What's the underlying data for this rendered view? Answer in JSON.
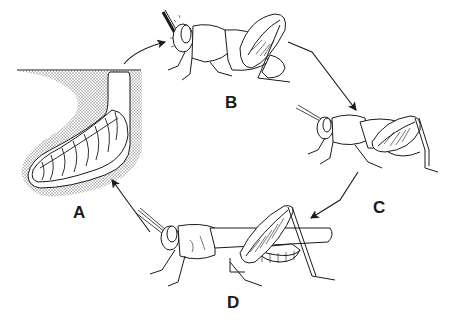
{
  "diagram": {
    "type": "life-cycle",
    "stages": [
      {
        "id": "A",
        "label": "A",
        "depiction": "egg-pod-in-soil"
      },
      {
        "id": "B",
        "label": "B",
        "depiction": "young-nymph"
      },
      {
        "id": "C",
        "label": "C",
        "depiction": "older-nymph"
      },
      {
        "id": "D",
        "label": "D",
        "depiction": "adult-grasshopper"
      }
    ],
    "arrows": [
      {
        "from": "A",
        "to": "B"
      },
      {
        "from": "B",
        "to": "C"
      },
      {
        "from": "C",
        "to": "D"
      },
      {
        "from": "D",
        "to": "A"
      }
    ],
    "colors": {
      "line": "#1a1a1a",
      "soil_stipple": "#9a9a9a",
      "background": "#ffffff"
    }
  }
}
